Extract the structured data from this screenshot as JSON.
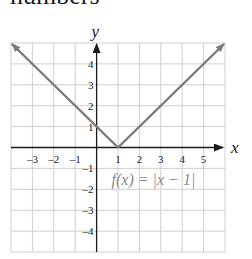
{
  "header": {
    "text": "numbers"
  },
  "chart_data": {
    "type": "line",
    "title": "",
    "function_label": "f(x) = |x − 1|",
    "xlabel": "x",
    "ylabel": "y",
    "xlim": [
      -4,
      6
    ],
    "ylim": [
      -5,
      5
    ],
    "grid": true,
    "x_ticks": [
      -3,
      -2,
      -1,
      1,
      2,
      3,
      4,
      5
    ],
    "y_ticks": [
      4,
      3,
      2,
      1,
      -1,
      -2,
      -3,
      -4
    ],
    "series": [
      {
        "name": "f(x) = |x − 1|",
        "x": [
          -4,
          1,
          6
        ],
        "y": [
          5,
          0,
          5
        ]
      }
    ],
    "vertex": [
      1,
      0
    ],
    "colors": {
      "line": "#7a7a7a",
      "grid": "#cfcfcf",
      "axis": "#1a1a1a",
      "label": "#8a8a8a"
    }
  }
}
